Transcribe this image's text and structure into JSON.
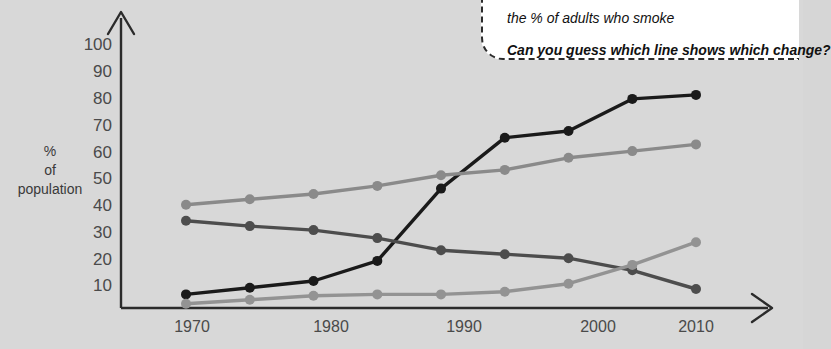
{
  "callout": {
    "name": "speech-bubble",
    "line1": "the % of adults who smoke",
    "line2": "Can you guess which line shows which change?"
  },
  "axes": {
    "y_label_line1": "%",
    "y_label_line2": "of",
    "y_label_line3": "population",
    "y_ticks": [
      "100",
      "90",
      "80",
      "70",
      "60",
      "50",
      "40",
      "30",
      "20",
      "10"
    ],
    "x_ticks": [
      "1970",
      "1980",
      "1990",
      "2000",
      "2010"
    ],
    "y_arrow": "up-arrow",
    "x_arrow": "right-arrow"
  },
  "chart_data": {
    "type": "line",
    "title": "",
    "xlabel": "",
    "ylabel": "% of population",
    "x": [
      1970,
      1975,
      1980,
      1985,
      1990,
      1995,
      2000,
      2005,
      2010
    ],
    "xlim": [
      1967,
      2012
    ],
    "ylim": [
      0,
      105
    ],
    "y_ticks": [
      10,
      20,
      30,
      40,
      50,
      60,
      70,
      80,
      90,
      100
    ],
    "x_ticks": [
      1970,
      1980,
      1990,
      2000,
      2010
    ],
    "grid": false,
    "legend": "none",
    "series": [
      {
        "name": "line-a-black",
        "color": "#1a1a1a",
        "values": [
          6.5,
          9,
          11.5,
          19,
          46,
          65,
          67.5,
          79.5,
          81
        ]
      },
      {
        "name": "line-b-medium-gray",
        "color": "#8a8a8a",
        "values": [
          40,
          42,
          44,
          47,
          51,
          53,
          57.5,
          60,
          62.5
        ]
      },
      {
        "name": "line-c-dark-gray",
        "color": "#4d4d4d",
        "values": [
          34,
          32,
          30.5,
          27.5,
          23,
          21.5,
          20,
          15.5,
          8.5
        ]
      },
      {
        "name": "line-d-light-gray",
        "color": "#939393",
        "values": [
          3,
          4.5,
          6,
          6.5,
          6.5,
          7.5,
          10.5,
          17.5,
          26
        ]
      }
    ]
  }
}
